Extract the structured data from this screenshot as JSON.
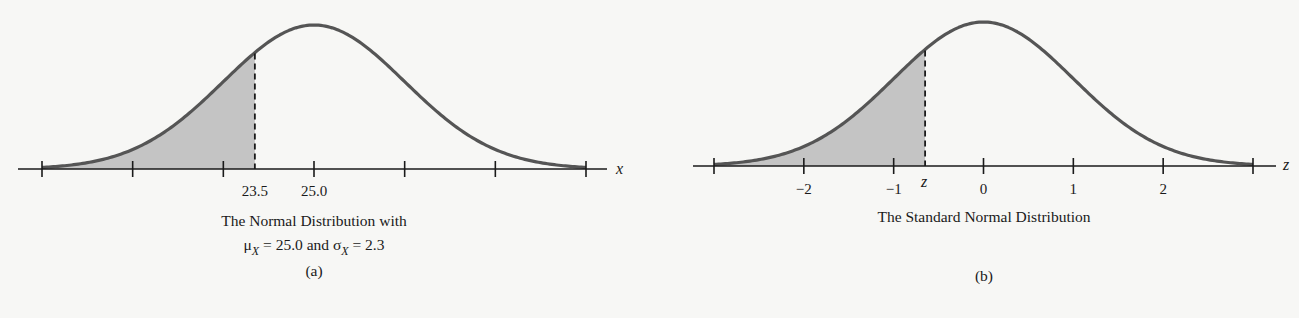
{
  "chart_data": [
    {
      "type": "area",
      "panel_label": "(a)",
      "title_line1": "The Normal Distribution with",
      "title_line2": {
        "mu_symbol": "μ",
        "mu_sub": "X",
        "mu_text": " = 25.0 and ",
        "sigma_symbol": "σ",
        "sigma_sub": "X",
        "sigma_text": " = 2.3"
      },
      "distribution": {
        "family": "normal",
        "mean": 25.0,
        "sd": 2.3
      },
      "xlabel": "x",
      "xlim": [
        17.6,
        32.4
      ],
      "ticks": [
        18.1,
        20.4,
        22.7,
        25.0,
        27.3,
        29.6,
        31.9
      ],
      "tick_labels": [
        {
          "value": 23.5,
          "text": "23.5"
        },
        {
          "value": 25.0,
          "text": "25.0"
        }
      ],
      "shaded_region": {
        "from": "-inf",
        "to": 23.5,
        "color": "#c4c4c4"
      },
      "cutoff_line": {
        "value": 23.5,
        "style": "dashed"
      },
      "curve_color": "#555555"
    },
    {
      "type": "area",
      "panel_label": "(b)",
      "title_line1": "The Standard Normal Distribution",
      "distribution": {
        "family": "normal",
        "mean": 0,
        "sd": 1
      },
      "xlabel": "z",
      "xlim": [
        -3.25,
        3.25
      ],
      "ticks": [
        -3,
        -2,
        -1,
        0,
        1,
        2,
        3
      ],
      "tick_labels": [
        {
          "value": -2,
          "text": "−2"
        },
        {
          "value": -1,
          "text": "−1"
        },
        {
          "value": 0,
          "text": "0"
        },
        {
          "value": 1,
          "text": "1"
        },
        {
          "value": 2,
          "text": "2"
        }
      ],
      "shaded_region": {
        "from": "-inf",
        "to": -0.65,
        "color": "#c4c4c4"
      },
      "cutoff_line": {
        "value": -0.65,
        "style": "dashed",
        "label": "z"
      },
      "curve_color": "#555555"
    }
  ]
}
